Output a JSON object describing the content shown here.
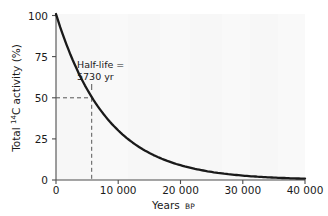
{
  "chart_data": {
    "type": "line",
    "title": "",
    "xlabel": "Years BP",
    "xlabel_main": "Years",
    "xlabel_small": "BP",
    "ylabel": "Total 14C activity (%)",
    "ylabel_prefix": "Total ",
    "ylabel_sup": "14",
    "ylabel_suffix": "C activity (%)",
    "xlim": [
      0,
      40000
    ],
    "ylim": [
      0,
      100
    ],
    "grid": false,
    "legend": "none",
    "series": [
      {
        "name": "Total 14C activity",
        "model": "exponential decay",
        "half_life": 5730,
        "formula": "A = 100 * 0.5^(t/5730)",
        "x": [
          0,
          1000,
          2000,
          3000,
          4000,
          5000,
          5730,
          6000,
          7000,
          8000,
          9000,
          10000,
          12000,
          14000,
          16000,
          18000,
          20000,
          22000,
          24000,
          26000,
          28000,
          30000,
          32000,
          34000,
          36000,
          38000,
          40000
        ],
        "y": [
          100,
          88.6,
          78.5,
          69.6,
          61.6,
          54.6,
          50,
          48.4,
          42.9,
          38.0,
          33.6,
          29.8,
          23.4,
          18.3,
          14.4,
          11.3,
          8.9,
          7.0,
          5.5,
          4.3,
          3.4,
          2.6,
          2.1,
          1.6,
          1.3,
          1.0,
          0.8
        ]
      }
    ],
    "xticks": [
      0,
      10000,
      20000,
      30000,
      40000
    ],
    "xtick_labels": [
      "0",
      "10 000",
      "20 000",
      "30 000",
      "40 000"
    ],
    "yticks": [
      0,
      25,
      50,
      75,
      100
    ],
    "ytick_labels": [
      "0",
      "25",
      "50",
      "75",
      "100"
    ],
    "annotations": [
      {
        "name": "half-life-annotation",
        "line1": "Half-life =",
        "line2": "5730 yr",
        "x": 5730,
        "y": 50,
        "guide_lines": "dashed horizontal at y=50 from x=0 to x=5730; dashed vertical at x=5730 from y=0 to y=50"
      }
    ],
    "colors": {
      "curve": "#1a1a1a",
      "axis": "#4d4d4d",
      "dashed_guide": "#555555",
      "plot_background": "#f7f7f7",
      "page_background": "#ffffff",
      "text": "#1a1a1a"
    }
  }
}
